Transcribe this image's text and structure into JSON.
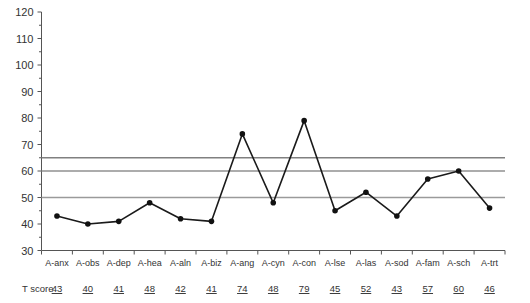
{
  "chart_data": {
    "type": "line",
    "title": "",
    "xlabel": "",
    "ylabel": "",
    "ylim": [
      30,
      120
    ],
    "yticks": [
      30,
      40,
      50,
      60,
      70,
      80,
      90,
      100,
      110,
      120
    ],
    "grid": false,
    "legend": "none",
    "categories": [
      "A-anx",
      "A-obs",
      "A-dep",
      "A-hea",
      "A-aln",
      "A-biz",
      "A-ang",
      "A-cyn",
      "A-con",
      "A-lse",
      "A-las",
      "A-sod",
      "A-fam",
      "A-sch",
      "A-trt"
    ],
    "values": [
      43,
      40,
      41,
      48,
      42,
      41,
      74,
      48,
      79,
      45,
      52,
      43,
      57,
      60,
      46
    ],
    "series": [
      {
        "name": "T score",
        "values": [
          43,
          40,
          41,
          48,
          42,
          41,
          74,
          48,
          79,
          45,
          52,
          43,
          57,
          60,
          46
        ]
      }
    ],
    "reference_lines": [
      {
        "value": 65,
        "color": "#808080"
      },
      {
        "value": 60,
        "color": "#909090"
      },
      {
        "value": 50,
        "color": "#9a9a9a"
      }
    ],
    "score_row": {
      "label": "T score",
      "values": [
        "43",
        "40",
        "41",
        "48",
        "42",
        "41",
        "74",
        "48",
        "79",
        "45",
        "52",
        "43",
        "57",
        "60",
        "46"
      ]
    }
  },
  "colors": {
    "line": "#1a1a1a",
    "marker": "#111111",
    "axis": "#555555",
    "text": "#333333",
    "background": "#ffffff"
  }
}
